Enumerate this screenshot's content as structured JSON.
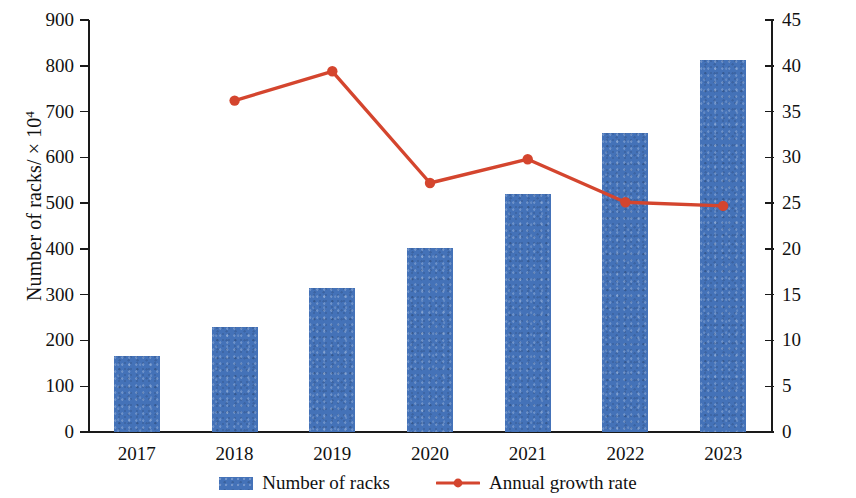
{
  "chart_data": {
    "type": "bar",
    "title": "",
    "subtitle": "",
    "xlabel": "",
    "categories": [
      "2017",
      "2018",
      "2019",
      "2020",
      "2021",
      "2022",
      "2023"
    ],
    "grid": false,
    "legend_position": "bottom",
    "axes": {
      "left": {
        "label": "Number of racks/ × 10",
        "label_exponent": "4",
        "label_full": "Number of racks/ × 10⁴",
        "min": 0,
        "max": 900,
        "step": 100,
        "ticks": [
          "0",
          "100",
          "200",
          "300",
          "400",
          "500",
          "600",
          "700",
          "800",
          "900"
        ]
      },
      "right": {
        "label": "Annual growth rate/%",
        "min": 0,
        "max": 45,
        "step": 5,
        "ticks": [
          "0",
          "5",
          "10",
          "15",
          "20",
          "25",
          "30",
          "35",
          "40",
          "45"
        ]
      }
    },
    "series": [
      {
        "name": "Number of racks",
        "type": "bar",
        "axis": "left",
        "color": "#4472b8",
        "unit": "× 10⁴",
        "values": [
          165,
          229,
          315,
          402,
          520,
          653,
          813
        ]
      },
      {
        "name": "Annual growth rate",
        "type": "line",
        "axis": "right",
        "color": "#d4452e",
        "marker": "circle",
        "unit": "%",
        "values": [
          null,
          36.2,
          39.4,
          27.2,
          29.8,
          25.1,
          24.7
        ]
      }
    ]
  },
  "legend": {
    "items": [
      {
        "label": "Number of racks",
        "marker": "bar-swatch",
        "color": "#4472b8"
      },
      {
        "label": "Annual growth rate",
        "marker": "line-marker",
        "color": "#d4452e"
      }
    ]
  },
  "colors": {
    "bar": "#4472b8",
    "line": "#d4452e",
    "axis": "#1a1a1a",
    "text": "#111111",
    "background": "#ffffff"
  }
}
